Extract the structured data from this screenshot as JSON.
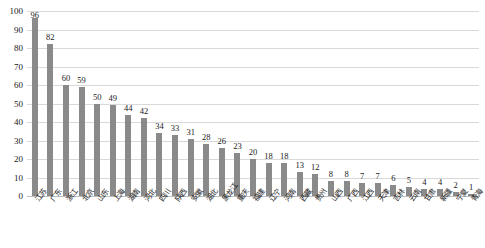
{
  "chart_data": {
    "type": "bar",
    "title": "",
    "subtitle": "",
    "xlabel": "",
    "ylabel": "",
    "ylim": [
      0,
      100
    ],
    "yticks": [
      0,
      10,
      20,
      30,
      40,
      50,
      60,
      70,
      80,
      90,
      100
    ],
    "grid": true,
    "legend": false,
    "bar_color": "#8a8a8a",
    "gridline_color": "#d9d9d9",
    "categories": [
      "江苏",
      "广东",
      "浙江",
      "北京",
      "山东",
      "上海",
      "湖南",
      "河北",
      "四川",
      "陕西",
      "安徽",
      "湖北",
      "黑龙江",
      "重庆",
      "福建",
      "辽宁",
      "河南",
      "西藏",
      "贵州",
      "山西",
      "广西",
      "江西",
      "天津",
      "吉林",
      "云南",
      "甘肃",
      "新疆",
      "宁夏",
      "青海"
    ],
    "values": [
      96,
      82,
      60,
      59,
      50,
      49,
      44,
      42,
      34,
      33,
      31,
      28,
      26,
      23,
      20,
      18,
      18,
      13,
      12,
      8,
      8,
      7,
      7,
      6,
      5,
      4,
      4,
      2,
      1
    ],
    "extra_categories_note": "",
    "data_labels": [
      "96",
      "82",
      "60",
      "59",
      "50",
      "49",
      "44",
      "42",
      "34",
      "33",
      "31",
      "28",
      "26",
      "23",
      "20",
      "18",
      "18",
      "13",
      "12",
      "8",
      "8",
      "7",
      "7",
      "6",
      "5",
      "4",
      "4",
      "2",
      "1"
    ]
  }
}
